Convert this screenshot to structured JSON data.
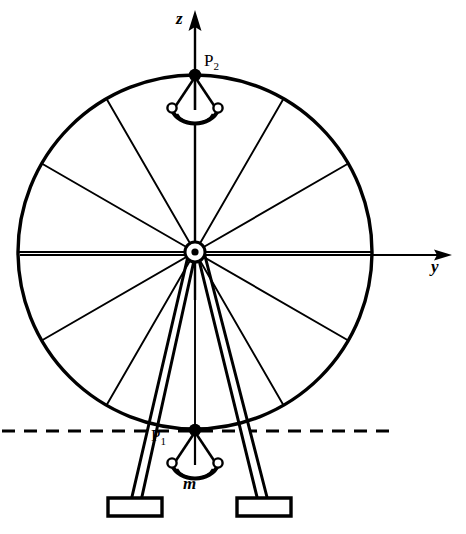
{
  "figure": {
    "kind": "mechanics-diagram",
    "background_color": "#ffffff",
    "ink_color": "#000000",
    "width": 466,
    "height": 534
  },
  "axes": {
    "vertical": {
      "name": "z-axis",
      "label": "z",
      "label_x": 176,
      "label_y": 10,
      "from": [
        195,
        300
      ],
      "to": [
        195,
        12
      ],
      "arrow": true
    },
    "horizontal": {
      "name": "y-axis",
      "label": "y",
      "label_x": 431,
      "label_y": 258,
      "from": [
        20,
        255
      ],
      "to": [
        452,
        255
      ],
      "arrow": true
    }
  },
  "points": [
    {
      "name": "P2",
      "label": "P",
      "subscript": "2",
      "label_x": 204,
      "label_y": 52,
      "x": 195,
      "y": 75,
      "marker": "filled-dot"
    },
    {
      "name": "P1",
      "label": "P",
      "subscript": "1",
      "label_x": 151,
      "label_y": 427,
      "x": 195,
      "y": 430,
      "marker": "filled-dot"
    }
  ],
  "mass_label": {
    "name": "mass-m",
    "text": "m",
    "x": 183,
    "y": 475
  },
  "wheel": {
    "center": [
      195,
      252
    ],
    "radius": 177,
    "rim_stroke_width": 3.2,
    "spoke_stroke_width": 1.8,
    "spoke_count": 12,
    "spoke_angles_deg": [
      0,
      30,
      60,
      90,
      120,
      150,
      180,
      210,
      240,
      270,
      300,
      330
    ],
    "hub": {
      "outer_radius": 10,
      "mid_radius": 6.5,
      "inner_radius": 3.2
    }
  },
  "gondolas": [
    {
      "name": "gondola-top",
      "attach": [
        195,
        75
      ],
      "cup_center_y": 111,
      "cup_rx": 23,
      "cup_ry": 16
    },
    {
      "name": "gondola-bottom",
      "attach": [
        195,
        430
      ],
      "cup_center_y": 466,
      "cup_rx": 23,
      "cup_ry": 16
    }
  ],
  "ground_line": {
    "name": "ground-reference-line",
    "style": "dashed",
    "y": 431,
    "x_start": 2,
    "x_end": 394,
    "dash": "13 9",
    "stroke_width": 3
  },
  "support_legs": [
    {
      "name": "support-leg-left",
      "top": [
        190,
        258
      ],
      "bottom": [
        134,
        500
      ],
      "width": 7,
      "foot": {
        "x": 108,
        "y": 498,
        "w": 54,
        "h": 18
      }
    },
    {
      "name": "support-leg-right",
      "top": [
        201,
        258
      ],
      "bottom": [
        262,
        500
      ],
      "width": 7,
      "foot": {
        "x": 237,
        "y": 498,
        "w": 54,
        "h": 18
      }
    }
  ]
}
